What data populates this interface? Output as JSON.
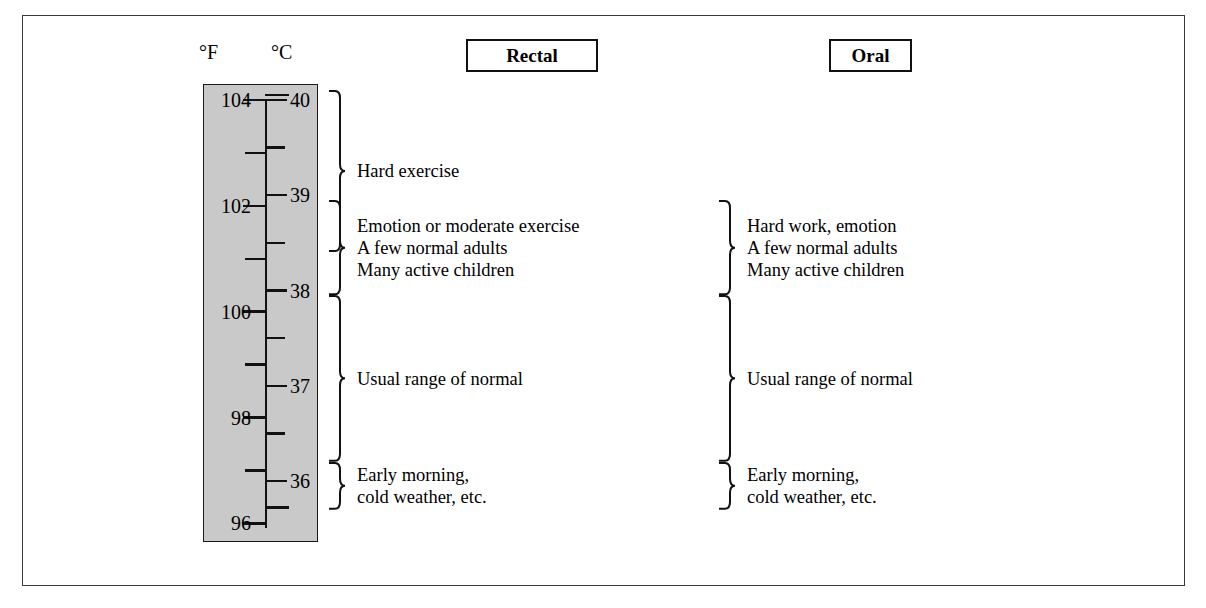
{
  "figure": {
    "type": "annotated-scale-diagram",
    "frame_color": "#3a3a3a",
    "column_fill": "#c9c9c9"
  },
  "scale": {
    "fahrenheit_label": "°F",
    "celsius_label": "°C",
    "fahrenheit_ticks": [
      "104",
      "102",
      "100",
      "98",
      "96"
    ],
    "celsius_ticks": [
      "40",
      "39",
      "38",
      "37",
      "36"
    ],
    "celsius_range": [
      35.7,
      40.1
    ],
    "fahrenheit_range": [
      96.2,
      104.2
    ]
  },
  "columns": [
    {
      "id": "rectal",
      "header": "Rectal"
    },
    {
      "id": "oral",
      "header": "Oral"
    }
  ],
  "chart_data": {
    "type": "table",
    "axis": {
      "celsius_ticks": [
        40,
        39,
        38,
        37,
        36
      ],
      "fahrenheit_ticks": [
        104,
        102,
        100,
        98,
        96
      ],
      "celsius_minor_step": 0.5,
      "fahrenheit_minor_step": 1
    },
    "columns": [
      "Rectal",
      "Oral"
    ],
    "bands": [
      {
        "column": "Rectal",
        "celsius_min": 38.4,
        "celsius_max": 40.1,
        "lines": [
          "Hard exercise"
        ]
      },
      {
        "column": "Rectal",
        "celsius_min": 37.95,
        "celsius_max": 38.95,
        "lines": [
          "Emotion or moderate exercise",
          "A few normal adults",
          "Many active children"
        ]
      },
      {
        "column": "Rectal",
        "celsius_min": 36.2,
        "celsius_max": 37.95,
        "lines": [
          "Usual range of normal"
        ]
      },
      {
        "column": "Rectal",
        "celsius_min": 35.7,
        "celsius_max": 36.2,
        "lines": [
          "Early morning,",
          "cold weather, etc."
        ]
      },
      {
        "column": "Oral",
        "celsius_min": 37.95,
        "celsius_max": 38.95,
        "lines": [
          "Hard work, emotion",
          "A few normal adults",
          "Many active children"
        ]
      },
      {
        "column": "Oral",
        "celsius_min": 36.2,
        "celsius_max": 37.95,
        "lines": [
          "Usual range of normal"
        ]
      },
      {
        "column": "Oral",
        "celsius_min": 35.7,
        "celsius_max": 36.2,
        "lines": [
          "Early morning,",
          "cold weather, etc."
        ]
      }
    ]
  },
  "rectal_groups": [
    {
      "id": "hard-exercise",
      "lines": [
        "Hard exercise"
      ]
    },
    {
      "id": "emotion-moderate",
      "lines": [
        "Emotion or moderate exercise",
        "A few normal adults",
        "Many active children"
      ]
    },
    {
      "id": "usual-normal",
      "lines": [
        "Usual range of normal"
      ]
    },
    {
      "id": "early-morning",
      "lines": [
        "Early morning,",
        "cold weather, etc."
      ]
    }
  ],
  "oral_groups": [
    {
      "id": "hard-work",
      "lines": [
        "Hard work, emotion",
        "A few normal adults",
        "Many active children"
      ]
    },
    {
      "id": "usual-normal",
      "lines": [
        "Usual range of normal"
      ]
    },
    {
      "id": "early-morning",
      "lines": [
        "Early morning,",
        "cold weather, etc."
      ]
    }
  ]
}
